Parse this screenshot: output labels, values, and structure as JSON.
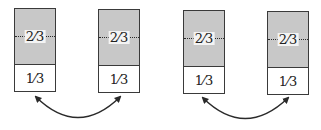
{
  "diagram": {
    "boxes": [
      {
        "id": "box-1",
        "x": 14,
        "y": 8,
        "top_label": "2⁄3",
        "bottom_label": "1⁄3"
      },
      {
        "id": "box-2",
        "x": 98,
        "y": 9,
        "top_label": "2⁄3",
        "bottom_label": "1⁄3"
      },
      {
        "id": "box-3",
        "x": 183,
        "y": 10,
        "top_label": "2⁄3",
        "bottom_label": "1⁄3"
      },
      {
        "id": "box-4",
        "x": 267,
        "y": 11,
        "top_label": "2⁄3",
        "bottom_label": "1⁄3"
      }
    ],
    "arrows": [
      {
        "from": "box-1",
        "to": "box-2",
        "type": "double-headed-arc"
      },
      {
        "from": "box-3",
        "to": "box-4",
        "type": "double-headed-arc"
      }
    ],
    "colors": {
      "stroke": "#3a3a3a",
      "shade": "#c8c8c8",
      "background": "#ffffff"
    }
  }
}
